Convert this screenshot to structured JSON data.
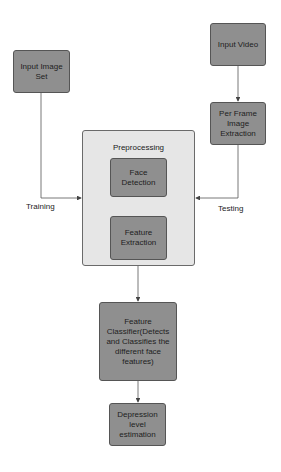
{
  "diagram": {
    "nodes": {
      "input_image_set": "Input Image Set",
      "input_video": "Input Video",
      "per_frame_extraction": "Per Frame Image Extraction",
      "preprocessing": "Preprocessing",
      "face_detection": "Face Detection",
      "feature_extraction": "Feature Extraction",
      "feature_classifier": "Feature Classifier(Detects and Classifies the different face features)",
      "depression_estimation": "Depression level estimation"
    },
    "edge_labels": {
      "training": "Training",
      "testing": "Testing"
    },
    "edges": [
      {
        "from": "Input Image Set",
        "to": "Preprocessing",
        "label": "Training"
      },
      {
        "from": "Input Video",
        "to": "Per Frame Image Extraction"
      },
      {
        "from": "Per Frame Image Extraction",
        "to": "Preprocessing",
        "label": "Testing"
      },
      {
        "from": "Face Detection",
        "to": "Feature Extraction"
      },
      {
        "from": "Preprocessing",
        "to": "Feature Classifier(Detects and Classifies the different face features)"
      },
      {
        "from": "Feature Classifier(Detects and Classifies the different face features)",
        "to": "Depression level estimation"
      }
    ],
    "colors": {
      "node_fill": "#8f8f8f",
      "container_fill": "#e6e6e6",
      "line": "#555555"
    }
  }
}
